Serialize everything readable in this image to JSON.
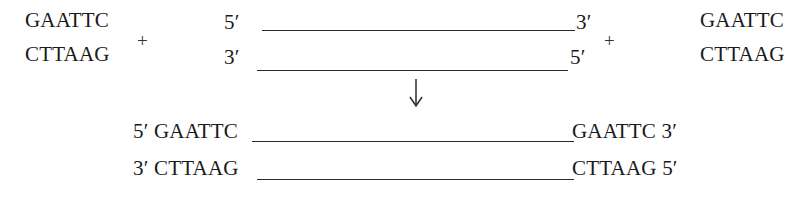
{
  "figure": {
    "line_color": "#2a2a2a",
    "text_color": "#1a1a1a",
    "background": "#ffffff"
  },
  "reactants": {
    "left_fragment": {
      "top_sequence": "GAATTC",
      "bottom_sequence": "CTTAAG"
    },
    "plus_left": "+",
    "duplex": {
      "top_left_end": "5′",
      "top_right_end": "3′",
      "bottom_left_end": "3′",
      "bottom_right_end": "5′"
    },
    "plus_right": "+",
    "right_fragment": {
      "top_sequence": "GAATTC",
      "bottom_sequence": "CTTAAG"
    }
  },
  "arrow": {
    "name": "downward-arrow",
    "direction": "down"
  },
  "product": {
    "top_strand_left": "5′ GAATTC",
    "top_strand_right": "GAATTC 3′",
    "bottom_strand_left": "3′ CTTAAG",
    "bottom_strand_right": "CTTAAG 5′"
  }
}
